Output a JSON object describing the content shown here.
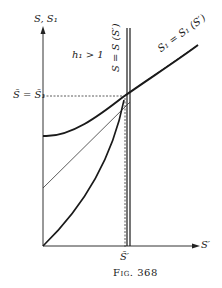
{
  "figure": {
    "caption": "Fig. 368",
    "y_axis_label": "S, S₁",
    "x_axis_label": "S′",
    "condition_label": "h₁ > 1",
    "equilibrium_label": "S̄ = S̄₁",
    "x_tick_label": "S̄′",
    "curve_labels": {
      "vertical_curve": "S = S (S′)",
      "diagonal_curve": "S₁ = S₁ (S′)"
    }
  },
  "colors": {
    "ink": "#1a1a1a",
    "background": "#ffffff"
  }
}
